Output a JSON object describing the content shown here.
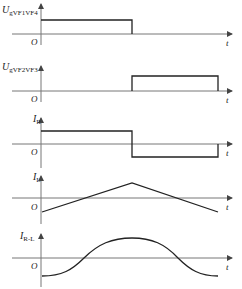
{
  "panels": [
    {
      "id": "ug-vf1vf4",
      "label_main": "U",
      "label_sub": "gVF1VF4",
      "origin": "O",
      "time": "t",
      "shape": "pulse 0 to T/2"
    },
    {
      "id": "ug-vf2vf3",
      "label_main": "U",
      "label_sub": "gVF2VF3",
      "origin": "O",
      "time": "t",
      "shape": "pulse T/2 to T"
    },
    {
      "id": "ir",
      "label_main": "I",
      "label_sub": "R",
      "origin": "O",
      "time": "t",
      "shape": "square wave +/-"
    },
    {
      "id": "il",
      "label_main": "I",
      "label_sub": "L",
      "origin": "O",
      "time": "t",
      "shape": "triangle"
    },
    {
      "id": "ir-l",
      "label_main": "I",
      "label_sub": "R-L",
      "origin": "O",
      "time": "t",
      "shape": "smoothed sinusoid"
    }
  ],
  "colors": {
    "axis": "#777777",
    "wave": "#222222",
    "text": "#222222"
  }
}
